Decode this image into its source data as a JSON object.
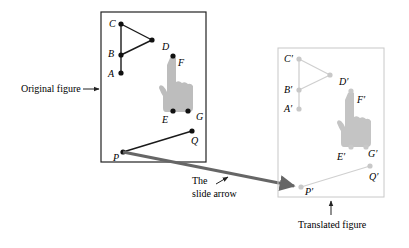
{
  "captions": {
    "original": "Original figure",
    "translated": "Translated figure",
    "slide_line1": "The",
    "slide_line2": "slide arrow"
  },
  "original_labels": {
    "A": "A",
    "B": "B",
    "C": "C",
    "D": "D",
    "E": "E",
    "F": "F",
    "G": "G",
    "P": "P",
    "Q": "Q"
  },
  "translated_labels": {
    "A": "A′",
    "B": "B′",
    "C": "C′",
    "D": "D′",
    "E": "E′",
    "F": "F′",
    "G": "G′",
    "P": "P′",
    "Q": "Q′"
  },
  "colors": {
    "original_stroke": "#1a1a1a",
    "translated_stroke": "#c8c8c8",
    "hand_fill": "#bdbdbd",
    "hand_fill_translated": "#c4c4c4",
    "slide_arrow": "#666666"
  }
}
